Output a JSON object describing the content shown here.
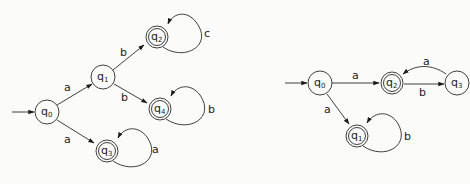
{
  "diagrams": [
    {
      "id": "left",
      "type": "finite-automaton",
      "start_state": "q0",
      "states": [
        {
          "name": "q0",
          "base": "q",
          "sub": "0",
          "x": 47,
          "y": 112,
          "accepting": false
        },
        {
          "name": "q1",
          "base": "q",
          "sub": "1",
          "x": 103,
          "y": 77,
          "accepting": false
        },
        {
          "name": "q2",
          "base": "q",
          "sub": "2",
          "x": 157,
          "y": 37,
          "accepting": true
        },
        {
          "name": "q4",
          "base": "q",
          "sub": "4",
          "x": 160,
          "y": 109,
          "accepting": true
        },
        {
          "name": "q3",
          "base": "q",
          "sub": "3",
          "x": 107,
          "y": 151,
          "accepting": true
        }
      ],
      "transitions": [
        {
          "from": "q0",
          "to": "q1",
          "label": "a"
        },
        {
          "from": "q0",
          "to": "q3",
          "label": "a"
        },
        {
          "from": "q1",
          "to": "q2",
          "label": "b"
        },
        {
          "from": "q1",
          "to": "q4",
          "label": "b"
        },
        {
          "from": "q2",
          "to": "q2",
          "label": "c"
        },
        {
          "from": "q4",
          "to": "q4",
          "label": "b"
        },
        {
          "from": "q3",
          "to": "q3",
          "label": "a"
        }
      ]
    },
    {
      "id": "right",
      "type": "finite-automaton",
      "start_state": "q0",
      "states": [
        {
          "name": "q0",
          "base": "q",
          "sub": "0",
          "x": 320,
          "y": 83,
          "accepting": false
        },
        {
          "name": "q2",
          "base": "q",
          "sub": "2",
          "x": 392,
          "y": 82,
          "accepting": true
        },
        {
          "name": "q3",
          "base": "q",
          "sub": "3",
          "x": 457,
          "y": 82,
          "accepting": false
        },
        {
          "name": "q1",
          "base": "q",
          "sub": "1",
          "x": 357,
          "y": 136,
          "accepting": true
        }
      ],
      "transitions": [
        {
          "from": "q0",
          "to": "q2",
          "label": "a"
        },
        {
          "from": "q0",
          "to": "q1",
          "label": "a"
        },
        {
          "from": "q2",
          "to": "q3",
          "label": "b"
        },
        {
          "from": "q3",
          "to": "q2",
          "label": "a"
        },
        {
          "from": "q1",
          "to": "q1",
          "label": "b"
        }
      ]
    }
  ],
  "labels": {
    "L": {
      "q0": {
        "base": "q",
        "sub": "0"
      },
      "q1": {
        "base": "q",
        "sub": "1"
      },
      "q2": {
        "base": "q",
        "sub": "2"
      },
      "q4": {
        "base": "q",
        "sub": "4"
      },
      "q3": {
        "base": "q",
        "sub": "3"
      },
      "e_q0_q1": "a",
      "e_q0_q3": "a",
      "e_q1_q2": "b",
      "e_q1_q4": "b",
      "loop_q2": "c",
      "loop_q4": "b",
      "loop_q3": "a"
    },
    "R": {
      "q0": {
        "base": "q",
        "sub": "0"
      },
      "q2": {
        "base": "q",
        "sub": "2"
      },
      "q3": {
        "base": "q",
        "sub": "3"
      },
      "q1": {
        "base": "q",
        "sub": "1"
      },
      "e_q0_q2": "a",
      "e_q0_q1": "a",
      "e_q2_q3": "b",
      "e_q3_q2": "a",
      "loop_q1": "b"
    }
  }
}
